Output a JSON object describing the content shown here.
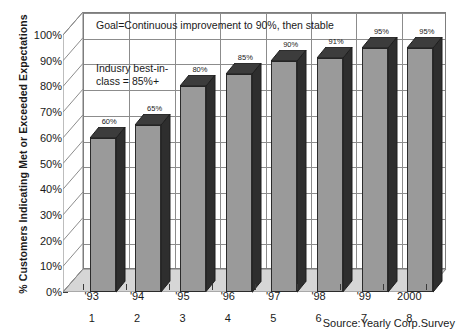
{
  "chart_data": {
    "type": "bar",
    "title": "",
    "xlabel": "",
    "ylabel": "% Customers Indicating Met or Exceeded Expectations",
    "ylim": [
      0,
      100
    ],
    "ytick_labels": [
      "100%",
      "90%",
      "80%",
      "70%",
      "60%",
      "50%",
      "40%",
      "30%",
      "20%",
      "10%",
      "0%"
    ],
    "ytick_values": [
      100,
      90,
      80,
      70,
      60,
      50,
      40,
      30,
      20,
      10,
      0
    ],
    "categories": [
      "'93",
      "'94",
      "'95",
      "'96",
      "'97",
      "'98",
      "'99",
      "2000"
    ],
    "category_index_labels": [
      "1",
      "2",
      "3",
      "4",
      "5",
      "6",
      "7",
      "8"
    ],
    "values": [
      60,
      65,
      80,
      85,
      90,
      91,
      95,
      95
    ],
    "data_labels": [
      "60%",
      "65%",
      "80%",
      "85%",
      "90%",
      "91%",
      "95%",
      "95%"
    ],
    "grid": true,
    "legend": "none",
    "style": "3d-column",
    "annotations": [
      "Goal=Continuous improvement to 90%, then stable",
      "Indusry best-in-\nclass = 85%+"
    ],
    "source": "Source:Yearly Corp.Survey"
  },
  "axes": {
    "y_title": "% Customers Indicating Met or Exceeded Expectations"
  },
  "annotations": {
    "goal": "Goal=Continuous improvement to 90%, then stable",
    "best_in_class": "Indusry best-in-\nclass = 85%+"
  },
  "footer": {
    "source": "Source:Yearly Corp.Survey"
  },
  "colors": {
    "bar_front": "#9a9a9a",
    "bar_side": "#2e2e2e",
    "bar_top": "#3c3c3c",
    "grid": "#8c8c8c",
    "floor": "#d6d6d6",
    "plot_background": "#ffffff",
    "text": "#1a1a1a"
  }
}
